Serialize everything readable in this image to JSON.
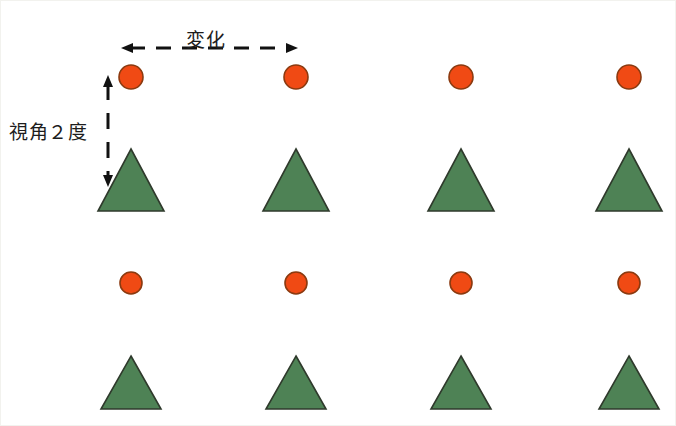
{
  "figure": {
    "title_text": "",
    "background_color": "#ffffff",
    "width": 676,
    "height": 426,
    "annotations": {
      "horizontal": {
        "label": "変化",
        "icon": "double-headed-dashed-arrow-horizontal",
        "x1": 120,
        "x2": 297,
        "y": 47,
        "color": "#111111"
      },
      "vertical": {
        "label": "視角２度",
        "icon": "double-headed-dashed-arrow-vertical",
        "x": 107,
        "y1": 74,
        "y2": 186,
        "color": "#111111"
      }
    },
    "colors": {
      "circle_fill": "#f04a14",
      "circle_stroke": "#8a3a10",
      "triangle_fill": "#4e8255",
      "triangle_stroke": "#2f3a2c"
    },
    "columns_x": [
      130,
      295,
      460,
      628
    ],
    "stimulus_rows": [
      {
        "name": "upper-pair-row",
        "circle_cy": 76,
        "circle_r": 12,
        "triangle_apex_y": 148,
        "triangle_base_y": 210,
        "triangle_half_width": 33
      },
      {
        "name": "lower-pair-row",
        "circle_cy": 282,
        "circle_r": 11,
        "triangle_apex_y": 355,
        "triangle_base_y": 408,
        "triangle_half_width": 30
      }
    ]
  }
}
